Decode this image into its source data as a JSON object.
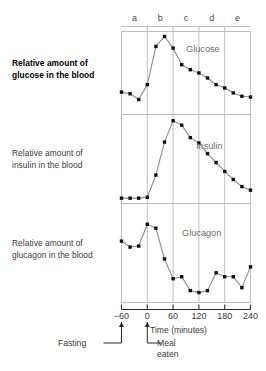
{
  "figure": {
    "background": "#ffffff",
    "line_color": "#8d8d8d",
    "marker_color": "#111111",
    "frame_color": "#b9b9b9",
    "axis_color": "#2b2b2b",
    "text_color": "#3a3a3a"
  },
  "row_labels": [
    {
      "line1": "Relative amount of",
      "line2": "glucose in the blood",
      "bold": true
    },
    {
      "line1": "Relative amount of",
      "line2": "insulin in the blood",
      "bold": false
    },
    {
      "line1": "Relative amount of",
      "line2": "glucagon in the blood",
      "bold": false
    }
  ],
  "phases": [
    {
      "label": "a",
      "start": -60,
      "end": 0
    },
    {
      "label": "b",
      "start": 0,
      "end": 60
    },
    {
      "label": "c",
      "start": 60,
      "end": 120
    },
    {
      "label": "d",
      "start": 120,
      "end": 180
    },
    {
      "label": "e",
      "start": 180,
      "end": 240
    }
  ],
  "axis": {
    "title": "Time (minutes)",
    "ticks": [
      -60,
      0,
      60,
      120,
      180,
      240
    ],
    "tick_labels": [
      "−60",
      "0",
      "60",
      "120",
      "180",
      "240"
    ],
    "xmin": -60,
    "xmax": 240
  },
  "annotations": [
    {
      "name": "fasting",
      "text_line1": "Fasting",
      "text_line2": "",
      "at_time": -60
    },
    {
      "name": "meal-eaten",
      "text_line1": "Meal",
      "text_line2": "eaten",
      "at_time": 0
    }
  ],
  "chart_data": {
    "type": "line",
    "title": "",
    "xlabel": "Time (minutes)",
    "ylabel": "Relative amount in the blood",
    "xlim": [
      -60,
      240
    ],
    "ylim": [
      0,
      1
    ],
    "grid": true,
    "grid_lines_at_x": [
      -60,
      0,
      60,
      120,
      180,
      240
    ],
    "legend": "inline-panel-label",
    "panels": [
      {
        "name": "Glucose",
        "label": "Glucose",
        "ylabel_line1": "Relative amount of",
        "ylabel_line2": "glucose in the blood",
        "x": [
          -60,
          -40,
          -20,
          0,
          20,
          40,
          60,
          80,
          100,
          120,
          140,
          160,
          180,
          200,
          220,
          240
        ],
        "y": [
          0.27,
          0.25,
          0.18,
          0.36,
          0.82,
          0.94,
          0.8,
          0.6,
          0.54,
          0.5,
          0.44,
          0.36,
          0.32,
          0.26,
          0.22,
          0.21
        ]
      },
      {
        "name": "Insulin",
        "label": "Insulin",
        "ylabel_line1": "Relative amount of",
        "ylabel_line2": "insulin in the blood",
        "x": [
          -60,
          -40,
          -20,
          0,
          20,
          40,
          60,
          80,
          100,
          120,
          140,
          160,
          180,
          200,
          220,
          240
        ],
        "y": [
          0.06,
          0.06,
          0.06,
          0.07,
          0.32,
          0.69,
          0.93,
          0.88,
          0.74,
          0.68,
          0.56,
          0.46,
          0.36,
          0.27,
          0.19,
          0.15
        ]
      },
      {
        "name": "Glucagon",
        "label": "Glucagon",
        "ylabel_line1": "Relative amount of",
        "ylabel_line2": "glucagon in the blood",
        "x": [
          -60,
          -40,
          -20,
          0,
          20,
          40,
          60,
          80,
          100,
          120,
          140,
          160,
          180,
          200,
          220,
          240
        ],
        "y": [
          0.62,
          0.56,
          0.57,
          0.79,
          0.75,
          0.44,
          0.24,
          0.26,
          0.12,
          0.1,
          0.12,
          0.3,
          0.26,
          0.26,
          0.15,
          0.36
        ]
      }
    ]
  }
}
